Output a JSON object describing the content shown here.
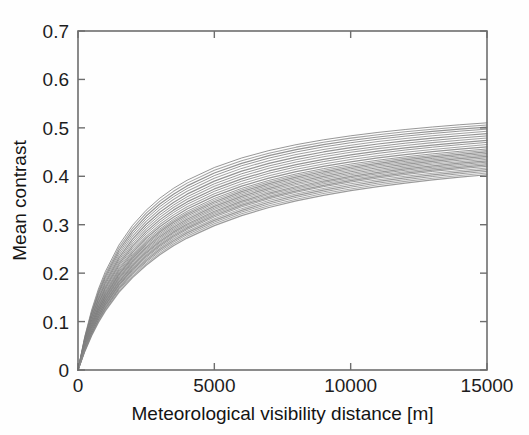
{
  "chart_data": {
    "type": "line",
    "title": "",
    "xlabel": "Meteorological visibility distance [m]",
    "ylabel": "Mean contrast",
    "xlim": [
      0,
      15000
    ],
    "ylim": [
      0,
      0.7
    ],
    "xticks": [
      0,
      5000,
      10000,
      15000
    ],
    "xtick_labels": [
      "0",
      "5000",
      "10000",
      "15000"
    ],
    "yticks": [
      0,
      0.1,
      0.2,
      0.3,
      0.4,
      0.5,
      0.6,
      0.7
    ],
    "ytick_labels": [
      "0",
      "0.1",
      "0.2",
      "0.3",
      "0.4",
      "0.5",
      "0.6",
      "0.7"
    ],
    "grid": false,
    "legend": null,
    "legend_position": "none",
    "tick_direction": "in",
    "box": true,
    "line_color": "#7a7a7a",
    "background_color": "#fefefe",
    "axis_color": "#6e6e6e",
    "x": [
      0,
      250,
      500,
      750,
      1000,
      1500,
      2000,
      2500,
      3000,
      3500,
      4000,
      5000,
      6000,
      7000,
      8000,
      9000,
      10000,
      11000,
      12000,
      13000,
      14000,
      15000
    ],
    "series": [
      {
        "name": "curve-01",
        "asymptote": 0.565,
        "half_distance": 1780,
        "values": [
          0,
          0.0697,
          0.124,
          0.1674,
          0.2029,
          0.2579,
          0.2986,
          0.3299,
          0.3548,
          0.375,
          0.3918,
          0.4181,
          0.4378,
          0.4531,
          0.4653,
          0.4753,
          0.4836,
          0.4906,
          0.4966,
          0.5018,
          0.5064,
          0.5104
        ]
      },
      {
        "name": "curve-02",
        "asymptote": 0.556,
        "half_distance": 1820,
        "values": [
          0,
          0.0676,
          0.1205,
          0.163,
          0.1979,
          0.2522,
          0.2926,
          0.3238,
          0.3487,
          0.369,
          0.3859,
          0.4124,
          0.4323,
          0.4478,
          0.4602,
          0.4703,
          0.4788,
          0.4859,
          0.492,
          0.4973,
          0.5019,
          0.506
        ]
      },
      {
        "name": "curve-03",
        "asymptote": 0.548,
        "half_distance": 1850,
        "values": [
          0,
          0.0657,
          0.1173,
          0.1589,
          0.1932,
          0.2468,
          0.2868,
          0.3179,
          0.3428,
          0.3631,
          0.3801,
          0.4067,
          0.4268,
          0.4425,
          0.455,
          0.4653,
          0.4739,
          0.4811,
          0.4873,
          0.4927,
          0.4974,
          0.5016
        ]
      },
      {
        "name": "curve-04",
        "asymptote": 0.54,
        "half_distance": 1880,
        "values": [
          0,
          0.0639,
          0.1143,
          0.155,
          0.1888,
          0.2417,
          0.2814,
          0.3124,
          0.3373,
          0.3576,
          0.3747,
          0.4014,
          0.4217,
          0.4375,
          0.4502,
          0.4606,
          0.4693,
          0.4766,
          0.4829,
          0.4884,
          0.4932,
          0.4974
        ]
      },
      {
        "name": "curve-05",
        "asymptote": 0.532,
        "half_distance": 1900,
        "values": [
          0,
          0.0624,
          0.1117,
          0.1516,
          0.1848,
          0.2368,
          0.2761,
          0.3069,
          0.3317,
          0.352,
          0.3691,
          0.3959,
          0.4163,
          0.4322,
          0.445,
          0.4555,
          0.4643,
          0.4717,
          0.4781,
          0.4836,
          0.4885,
          0.4928
        ]
      },
      {
        "name": "curve-06",
        "asymptote": 0.524,
        "half_distance": 1930,
        "values": [
          0,
          0.0607,
          0.1088,
          0.1478,
          0.1804,
          0.2316,
          0.2704,
          0.301,
          0.3257,
          0.346,
          0.3631,
          0.39,
          0.4106,
          0.4267,
          0.4396,
          0.4502,
          0.4591,
          0.4667,
          0.4731,
          0.4787,
          0.4837,
          0.4881
        ]
      },
      {
        "name": "curve-07",
        "asymptote": 0.517,
        "half_distance": 1955,
        "values": [
          0,
          0.0592,
          0.1063,
          0.1445,
          0.1765,
          0.227,
          0.2653,
          0.2957,
          0.3203,
          0.3405,
          0.3576,
          0.3845,
          0.4052,
          0.4214,
          0.4344,
          0.4451,
          0.4541,
          0.4617,
          0.4683,
          0.474,
          0.479,
          0.4834
        ]
      },
      {
        "name": "curve-08",
        "asymptote": 0.511,
        "half_distance": 1980,
        "values": [
          0,
          0.0579,
          0.104,
          0.1415,
          0.173,
          0.2228,
          0.2607,
          0.2908,
          0.3153,
          0.3355,
          0.3525,
          0.3794,
          0.4002,
          0.4164,
          0.4295,
          0.4403,
          0.4494,
          0.4571,
          0.4637,
          0.4695,
          0.4746,
          0.4791
        ]
      },
      {
        "name": "curve-09",
        "asymptote": 0.505,
        "half_distance": 2000,
        "values": [
          0,
          0.0566,
          0.1018,
          0.1386,
          0.1695,
          0.2185,
          0.2558,
          0.2858,
          0.31,
          0.3301,
          0.3471,
          0.3739,
          0.3947,
          0.411,
          0.4241,
          0.435,
          0.4441,
          0.4519,
          0.4586,
          0.4644,
          0.4696,
          0.4742
        ]
      },
      {
        "name": "curve-10",
        "asymptote": 0.5,
        "half_distance": 2030,
        "values": [
          0,
          0.0553,
          0.0995,
          0.1357,
          0.1661,
          0.2145,
          0.2514,
          0.2811,
          0.3052,
          0.3252,
          0.3422,
          0.369,
          0.3898,
          0.4062,
          0.4194,
          0.4303,
          0.4395,
          0.4474,
          0.4542,
          0.4601,
          0.4653,
          0.47
        ]
      },
      {
        "name": "curve-11",
        "asymptote": 0.494,
        "half_distance": 2050,
        "values": [
          0,
          0.0542,
          0.0976,
          0.1331,
          0.163,
          0.2107,
          0.2471,
          0.2765,
          0.3004,
          0.3203,
          0.3372,
          0.3639,
          0.3847,
          0.4012,
          0.4145,
          0.4254,
          0.4347,
          0.4426,
          0.4494,
          0.4554,
          0.4607,
          0.4654
        ]
      },
      {
        "name": "curve-12",
        "asymptote": 0.489,
        "half_distance": 2075,
        "values": [
          0,
          0.0531,
          0.0957,
          0.1306,
          0.16,
          0.207,
          0.243,
          0.2721,
          0.2958,
          0.3156,
          0.3324,
          0.359,
          0.3798,
          0.3963,
          0.4096,
          0.4206,
          0.4299,
          0.4379,
          0.4448,
          0.4508,
          0.4561,
          0.4609
        ]
      },
      {
        "name": "curve-13",
        "asymptote": 0.484,
        "half_distance": 2100,
        "values": [
          0,
          0.052,
          0.0938,
          0.1282,
          0.1571,
          0.2035,
          0.239,
          0.2678,
          0.2913,
          0.311,
          0.3277,
          0.3542,
          0.375,
          0.3915,
          0.4048,
          0.4158,
          0.4252,
          0.4332,
          0.4402,
          0.4463,
          0.4516,
          0.4564
        ]
      },
      {
        "name": "curve-14",
        "asymptote": 0.48,
        "half_distance": 2120,
        "values": [
          0,
          0.0512,
          0.0924,
          0.1263,
          0.1549,
          0.2008,
          0.236,
          0.2646,
          0.288,
          0.3076,
          0.3243,
          0.3508,
          0.3716,
          0.3881,
          0.4015,
          0.4125,
          0.4219,
          0.43,
          0.437,
          0.4431,
          0.4484,
          0.4532
        ]
      },
      {
        "name": "curve-15",
        "asymptote": 0.476,
        "half_distance": 2140,
        "values": [
          0,
          0.0504,
          0.091,
          0.1245,
          0.1527,
          0.1982,
          0.2331,
          0.2615,
          0.2848,
          0.3044,
          0.3211,
          0.3475,
          0.3683,
          0.3848,
          0.3982,
          0.4093,
          0.4187,
          0.4268,
          0.4338,
          0.44,
          0.4454,
          0.4502
        ]
      },
      {
        "name": "curve-16",
        "asymptote": 0.472,
        "half_distance": 2160,
        "values": [
          0,
          0.0496,
          0.0896,
          0.1227,
          0.1505,
          0.1956,
          0.2302,
          0.2584,
          0.2816,
          0.3011,
          0.3178,
          0.3442,
          0.365,
          0.3815,
          0.395,
          0.4061,
          0.4156,
          0.4237,
          0.4307,
          0.4369,
          0.4423,
          0.4472
        ]
      },
      {
        "name": "curve-17",
        "asymptote": 0.468,
        "half_distance": 2180,
        "values": [
          0,
          0.0488,
          0.0882,
          0.1209,
          0.1484,
          0.193,
          0.2274,
          0.2554,
          0.2785,
          0.298,
          0.3146,
          0.341,
          0.3618,
          0.3784,
          0.3919,
          0.403,
          0.4125,
          0.4206,
          0.4277,
          0.4339,
          0.4394,
          0.4442
        ]
      },
      {
        "name": "curve-18",
        "asymptote": 0.464,
        "half_distance": 2200,
        "values": [
          0,
          0.048,
          0.0869,
          0.1191,
          0.1463,
          0.1904,
          0.2245,
          0.2524,
          0.2754,
          0.2948,
          0.3114,
          0.3378,
          0.3586,
          0.3752,
          0.3887,
          0.3999,
          0.4094,
          0.4176,
          0.4246,
          0.4309,
          0.4364,
          0.4412
        ]
      },
      {
        "name": "curve-19",
        "asymptote": 0.46,
        "half_distance": 2225,
        "values": [
          0,
          0.0472,
          0.0855,
          0.1173,
          0.1441,
          0.1877,
          0.2215,
          0.2492,
          0.2721,
          0.2915,
          0.3081,
          0.3344,
          0.3552,
          0.3719,
          0.3854,
          0.3966,
          0.4061,
          0.4143,
          0.4214,
          0.4277,
          0.4332,
          0.4381
        ]
      },
      {
        "name": "curve-20",
        "asymptote": 0.457,
        "half_distance": 2250,
        "values": [
          0,
          0.0464,
          0.0842,
          0.1156,
          0.1421,
          0.1853,
          0.2188,
          0.2463,
          0.2691,
          0.2885,
          0.305,
          0.3313,
          0.3521,
          0.3688,
          0.3823,
          0.3936,
          0.4031,
          0.4113,
          0.4184,
          0.4247,
          0.4302,
          0.4352
        ]
      },
      {
        "name": "curve-21",
        "asymptote": 0.453,
        "half_distance": 2275,
        "values": [
          0,
          0.0456,
          0.0828,
          0.1138,
          0.14,
          0.1827,
          0.2159,
          0.2432,
          0.2658,
          0.2852,
          0.3016,
          0.3279,
          0.3487,
          0.3654,
          0.3789,
          0.3902,
          0.3998,
          0.408,
          0.4151,
          0.4214,
          0.427,
          0.4319
        ]
      },
      {
        "name": "curve-22",
        "asymptote": 0.45,
        "half_distance": 2300,
        "values": [
          0,
          0.0449,
          0.0817,
          0.1123,
          0.1382,
          0.1806,
          0.2135,
          0.2406,
          0.2632,
          0.2824,
          0.2988,
          0.325,
          0.3459,
          0.3625,
          0.3761,
          0.3874,
          0.397,
          0.4052,
          0.4124,
          0.4187,
          0.4242,
          0.4292
        ]
      },
      {
        "name": "curve-23",
        "asymptote": 0.447,
        "half_distance": 2330,
        "values": [
          0,
          0.0441,
          0.0804,
          0.1106,
          0.1363,
          0.1783,
          0.2109,
          0.2379,
          0.2603,
          0.2795,
          0.2958,
          0.322,
          0.3428,
          0.3595,
          0.373,
          0.3844,
          0.394,
          0.4023,
          0.4094,
          0.4158,
          0.4213,
          0.4263
        ]
      },
      {
        "name": "curve-24",
        "asymptote": 0.444,
        "half_distance": 2360,
        "values": [
          0,
          0.0433,
          0.0791,
          0.109,
          0.1344,
          0.176,
          0.2084,
          0.2352,
          0.2575,
          0.2766,
          0.2929,
          0.319,
          0.3398,
          0.3565,
          0.37,
          0.3814,
          0.391,
          0.3993,
          0.4065,
          0.4128,
          0.4184,
          0.4234
        ]
      },
      {
        "name": "curve-25",
        "asymptote": 0.441,
        "half_distance": 2390,
        "values": [
          0,
          0.0426,
          0.0779,
          0.1074,
          0.1326,
          0.1738,
          0.2059,
          0.2325,
          0.2547,
          0.2738,
          0.29,
          0.316,
          0.3368,
          0.3535,
          0.3671,
          0.3785,
          0.3881,
          0.3964,
          0.4036,
          0.41,
          0.4156,
          0.4206
        ]
      },
      {
        "name": "curve-26",
        "asymptote": 0.437,
        "half_distance": 2420,
        "values": [
          0,
          0.0418,
          0.0765,
          0.1056,
          0.1305,
          0.1712,
          0.203,
          0.2293,
          0.2514,
          0.2704,
          0.2865,
          0.3124,
          0.3332,
          0.3499,
          0.3635,
          0.3749,
          0.3845,
          0.3928,
          0.4,
          0.4064,
          0.412,
          0.417
        ]
      },
      {
        "name": "curve-27",
        "asymptote": 0.434,
        "half_distance": 2460,
        "values": [
          0,
          0.041,
          0.0751,
          0.1038,
          0.1283,
          0.1686,
          0.2001,
          0.2262,
          0.2482,
          0.267,
          0.2831,
          0.309,
          0.3297,
          0.3464,
          0.36,
          0.3714,
          0.381,
          0.3893,
          0.3966,
          0.403,
          0.4086,
          0.4136
        ]
      },
      {
        "name": "curve-28",
        "asymptote": 0.43,
        "half_distance": 2500,
        "values": [
          0,
          0.0401,
          0.0737,
          0.1019,
          0.1261,
          0.1659,
          0.1971,
          0.223,
          0.2449,
          0.2636,
          0.2796,
          0.3055,
          0.3262,
          0.3429,
          0.3565,
          0.3679,
          0.3776,
          0.3859,
          0.3931,
          0.3995,
          0.4052,
          0.4102
        ]
      },
      {
        "name": "curve-29",
        "asymptote": 0.426,
        "half_distance": 2540,
        "values": [
          0,
          0.0393,
          0.0722,
          0.1,
          0.1238,
          0.1631,
          0.194,
          0.2197,
          0.2414,
          0.2601,
          0.276,
          0.3018,
          0.3225,
          0.3392,
          0.3528,
          0.3643,
          0.3739,
          0.3823,
          0.3895,
          0.3959,
          0.4016,
          0.4067
        ]
      },
      {
        "name": "curve-30",
        "asymptote": 0.422,
        "half_distance": 2590,
        "values": [
          0,
          0.0384,
          0.0707,
          0.098,
          0.1215,
          0.1602,
          0.1908,
          0.2163,
          0.2379,
          0.2565,
          0.2724,
          0.2981,
          0.3188,
          0.3355,
          0.3491,
          0.3606,
          0.3703,
          0.3787,
          0.3859,
          0.3924,
          0.3981,
          0.4032
        ]
      }
    ]
  },
  "figure": {
    "plot_left_px": 78,
    "plot_right_px": 487,
    "plot_top_px": 31,
    "plot_bottom_px": 370
  }
}
